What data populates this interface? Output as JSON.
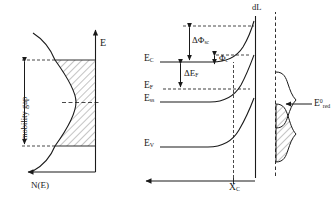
{
  "figure": {
    "type": "schematic-diagram",
    "ink_color": "#1a1a1a",
    "hatch_color": "#555555"
  },
  "left_panel": {
    "name": "density-of-states-plot",
    "y_axis_label": "E",
    "x_axis_label": "N(E)",
    "gap_label": "mobility gap",
    "midgap_marker": "dashed",
    "mobility_gap_top_y": 60,
    "mobility_gap_bottom_y": 145,
    "curve_type": "band-tail density of states with hatched occupied region"
  },
  "right_panel": {
    "name": "band-bending-diagram",
    "levels": [
      {
        "id": "E_C",
        "base": "E",
        "sub": "C",
        "label_y": 59,
        "flat_y": 62,
        "desc": "conduction band edge"
      },
      {
        "id": "E_F",
        "base": "E",
        "sub": "F",
        "label_y": 86,
        "flat_y": 89,
        "desc": "Fermi level"
      },
      {
        "id": "E_ss",
        "base": "E",
        "sub": "ss",
        "label_y": 99,
        "flat_y": 102,
        "desc": "surface state level"
      },
      {
        "id": "E_V",
        "base": "E",
        "sub": "V",
        "label_y": 143,
        "flat_y": 147,
        "desc": "valence band edge"
      }
    ],
    "annotations": [
      {
        "id": "dPhi_sc",
        "base": "ΔΦ",
        "sub": "sc",
        "desc": "space-charge potential drop"
      },
      {
        "id": "Phi_c",
        "base": "Φ",
        "sub": "c",
        "desc": "Helmholtz / contact potential"
      },
      {
        "id": "dE_F",
        "base": "ΔE",
        "sub": "F",
        "desc": "Fermi level shift"
      }
    ],
    "interface_label": "dL",
    "depth_label": {
      "base": "X",
      "sub": "C"
    },
    "x_axis_label": "",
    "redox_label": {
      "base": "E",
      "sup": "0",
      "sub": "red"
    },
    "redox_distribution": {
      "upper_lobe": "oxidized states (unfilled)",
      "lower_lobe": "reduced states (hatched)"
    }
  }
}
